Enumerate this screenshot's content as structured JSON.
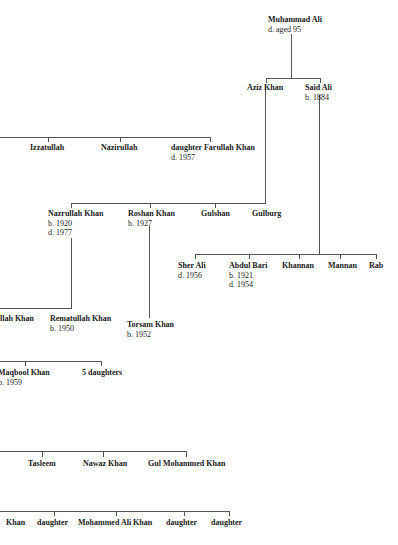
{
  "diagram": {
    "type": "family-tree",
    "nodes": {
      "muhammad_ali": {
        "name": "Muhammad Ali",
        "meta": [
          "d. aged 95"
        ]
      },
      "aziz_khan": {
        "name": "Aziz Khan",
        "meta": []
      },
      "said_ali": {
        "name": "Said Ali",
        "meta": [
          "b. 1884"
        ]
      },
      "izzatullah": {
        "name": "Izzatullah",
        "meta": []
      },
      "nazirullah": {
        "name": "Nazirullah",
        "meta": []
      },
      "daughter_1": {
        "name": "daughter",
        "meta": [
          "d. 1957"
        ]
      },
      "farullah_khan": {
        "name": "Farullah Khan",
        "meta": []
      },
      "nazrullah_khan": {
        "name": "Nazrullah Khan",
        "meta": [
          "b. 1920",
          "d. 1977"
        ]
      },
      "roshan_khan": {
        "name": "Roshan Khan",
        "meta": [
          "b. 1927"
        ]
      },
      "gulshan": {
        "name": "Gulshan",
        "meta": []
      },
      "gulburg": {
        "name": "Gulburg",
        "meta": []
      },
      "sher_ali": {
        "name": "Sher Ali",
        "meta": [
          "d. 1956"
        ]
      },
      "abdul_bari": {
        "name": "Abdul Bari",
        "meta": [
          "b. 1921",
          "d. 1954"
        ]
      },
      "khannan": {
        "name": "Khannan",
        "meta": []
      },
      "mannan": {
        "name": "Mannan",
        "meta": []
      },
      "rab": {
        "name": "Rab",
        "meta": []
      },
      "ullah_khan": {
        "name": "llah Khan",
        "meta": []
      },
      "rematullah_khan": {
        "name": "Rematullah Khan",
        "meta": [
          "b. 1950"
        ]
      },
      "torsam_khan": {
        "name": "Torsam Khan",
        "meta": [
          "b. 1952"
        ]
      },
      "maqbool_khan": {
        "name": "Maqbool Khan",
        "meta": [
          "b. 1959"
        ]
      },
      "five_daughters": {
        "name": "5 daughters",
        "meta": []
      },
      "tasleem": {
        "name": "Tasleem",
        "meta": []
      },
      "nawaz_khan": {
        "name": "Nawaz Khan",
        "meta": []
      },
      "gul_mohammed_khan": {
        "name": "Gul Mohammed Khan",
        "meta": []
      },
      "khan_bottom": {
        "name": "Khan",
        "meta": []
      },
      "daughter_2": {
        "name": "daughter",
        "meta": []
      },
      "mohammed_ali_khan": {
        "name": "Mohammed Ali Khan",
        "meta": []
      },
      "daughter_3": {
        "name": "daughter",
        "meta": []
      },
      "daughter_4": {
        "name": "daughter",
        "meta": []
      }
    },
    "relations": [
      {
        "parent": "Muhammad Ali",
        "children": [
          "Aziz Khan",
          "Said Ali"
        ]
      },
      {
        "parent": "(off-page)",
        "children": [
          "Izzatullah",
          "Nazirullah",
          "daughter"
        ]
      },
      {
        "parent": "Aziz Khan",
        "children": [
          "Nazrullah Khan",
          "Roshan Khan",
          "Gulshan",
          "Gulburg"
        ]
      },
      {
        "parent": "Said Ali",
        "children": [
          "Sher Ali",
          "Abdul Bari",
          "Khannan",
          "Mannan",
          "Rab"
        ]
      },
      {
        "parent": "Nazrullah Khan",
        "children": [
          "llah Khan",
          "Rematullah Khan"
        ]
      },
      {
        "parent": "Roshan Khan",
        "children": [
          "Torsam Khan"
        ]
      },
      {
        "parent": "(off-page)",
        "children": [
          "Maqbool Khan",
          "5 daughters"
        ]
      },
      {
        "parent": "(off-page)",
        "children": [
          "Tasleem",
          "Nawaz Khan",
          "Gul Mohammed Khan"
        ]
      },
      {
        "parent": "(off-page)",
        "children": [
          "Khan",
          "daughter",
          "Mohammed Ali Khan",
          "daughter",
          "daughter"
        ]
      }
    ]
  }
}
